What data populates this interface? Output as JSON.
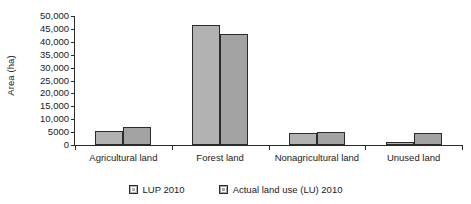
{
  "chart_data": {
    "type": "bar",
    "title": "",
    "xlabel": "",
    "ylabel": "Area (ha)",
    "ylim": [
      0,
      50000
    ],
    "grid": false,
    "legend_position": "bottom",
    "categories": [
      "Agricultural land",
      "Forest land",
      "Nonagricultural land",
      "Unused land"
    ],
    "ytick_labels": [
      "0",
      "5000",
      "10,000",
      "15,000",
      "20,000",
      "25,000",
      "30,000",
      "35,000",
      "40,000",
      "45,000",
      "50,000"
    ],
    "ytick_values": [
      0,
      5000,
      10000,
      15000,
      20000,
      25000,
      30000,
      35000,
      40000,
      45000,
      50000
    ],
    "series": [
      {
        "name": "LUP 2010",
        "color": "#b2b2b2",
        "values": [
          5600,
          46500,
          4800,
          1100
        ]
      },
      {
        "name": "Actual land use (LU) 2010",
        "color": "#a3a3a3",
        "values": [
          6900,
          43000,
          4900,
          4600
        ]
      }
    ]
  },
  "axis": {
    "y_title": "Area (ha)"
  },
  "legend": {
    "entries": [
      {
        "label": "LUP 2010"
      },
      {
        "label": "Actual land use (LU) 2010"
      }
    ]
  },
  "colors": {
    "series_1": "#b2b2b2",
    "series_2": "#a3a3a3",
    "axis": "#2b2b2b",
    "background": "#ffffff"
  }
}
